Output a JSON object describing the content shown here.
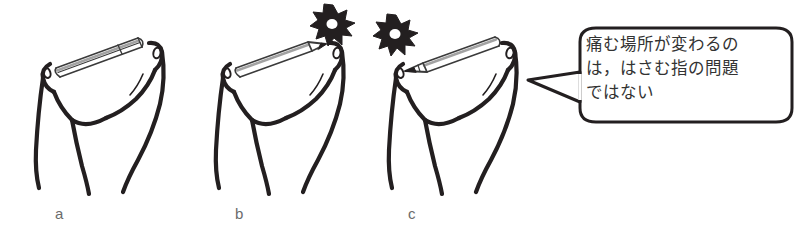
{
  "figure": {
    "type": "line-drawing-illustration",
    "background_color": "#ffffff",
    "ink_color": "#231f20",
    "label_color": "#6b6b6b",
    "panels": [
      {
        "id": "a",
        "label": "a",
        "subject": "hand pinching a pencil between thumb and index finger",
        "pencil_orientation": "blunt-end-right",
        "pain_burst": "none"
      },
      {
        "id": "b",
        "label": "b",
        "subject": "hand pinching a pencil between thumb and index finger",
        "pencil_orientation": "tip-right",
        "pain_burst": "right-fingertip"
      },
      {
        "id": "c",
        "label": "c",
        "subject": "hand pinching a pencil between thumb and index finger",
        "pencil_orientation": "tip-left",
        "pain_burst": "left-fingertip"
      }
    ]
  },
  "speech_bubble": {
    "text": "痛む場所が変わるの\nは，はさむ指の問題\nではない",
    "lines": [
      "痛む場所が変わるの",
      "は，はさむ指の問題",
      "ではない"
    ],
    "tail_direction": "left",
    "border_color": "#231f20",
    "fill_color": "#ffffff",
    "text_color": "#333333"
  },
  "icons": {
    "starburst": "pain-burst-icon",
    "pencil": "pencil-icon",
    "hand": "hand-icon"
  }
}
